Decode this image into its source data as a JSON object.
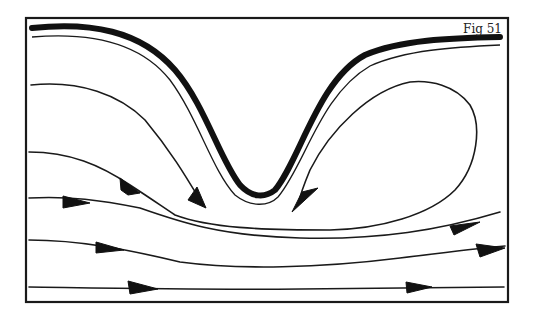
{
  "figure": {
    "label": "Fig 51",
    "colors": {
      "ink": "#1a1a1a",
      "background": "#ffffff"
    },
    "elements": {
      "boundary": "thick curved wall with thin parallel streamline",
      "streamlines_with_arrows": 7,
      "recirculation_loop": 1
    }
  }
}
